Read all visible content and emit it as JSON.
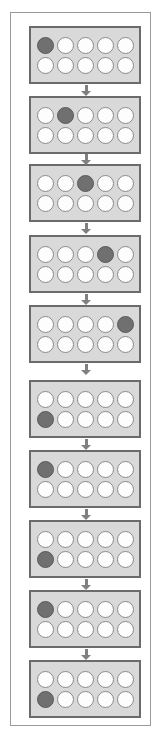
{
  "figure": {
    "title": "",
    "colors": {
      "page_background": "#ffffff",
      "outer_frame_border": "#9a9a9a",
      "panel_background": "#d9d9d9",
      "panel_border": "#6b6b6b",
      "cell_empty_fill": "#fdfdfd",
      "cell_empty_border": "#8a8a8a",
      "cell_filled_fill": "#707070",
      "cell_filled_border": "#5a5a5a",
      "arrow_color": "#808080"
    },
    "grid": {
      "columns": 5,
      "rows": 2,
      "cell_shape": "circle"
    },
    "panel_count": 10,
    "arrow_count": 9,
    "arrow_direction": "down"
  },
  "panels": [
    {
      "index": 1,
      "label": "",
      "top": 26,
      "filled_row": 1,
      "filled_column": 1,
      "cells": [
        [
          "filled",
          "empty",
          "empty",
          "empty",
          "empty"
        ],
        [
          "empty",
          "empty",
          "empty",
          "empty",
          "empty"
        ]
      ]
    },
    {
      "index": 2,
      "label": "",
      "top": 96,
      "filled_row": 1,
      "filled_column": 2,
      "cells": [
        [
          "empty",
          "filled",
          "empty",
          "empty",
          "empty"
        ],
        [
          "empty",
          "empty",
          "empty",
          "empty",
          "empty"
        ]
      ]
    },
    {
      "index": 3,
      "label": "",
      "top": 164,
      "filled_row": 1,
      "filled_column": 3,
      "cells": [
        [
          "empty",
          "empty",
          "filled",
          "empty",
          "empty"
        ],
        [
          "empty",
          "empty",
          "empty",
          "empty",
          "empty"
        ]
      ]
    },
    {
      "index": 4,
      "label": "",
      "top": 235,
      "filled_row": 1,
      "filled_column": 4,
      "cells": [
        [
          "empty",
          "empty",
          "empty",
          "filled",
          "empty"
        ],
        [
          "empty",
          "empty",
          "empty",
          "empty",
          "empty"
        ]
      ]
    },
    {
      "index": 5,
      "label": "",
      "top": 305,
      "filled_row": 1,
      "filled_column": 5,
      "cells": [
        [
          "empty",
          "empty",
          "empty",
          "empty",
          "filled"
        ],
        [
          "empty",
          "empty",
          "empty",
          "empty",
          "empty"
        ]
      ]
    },
    {
      "index": 6,
      "label": "",
      "top": 380,
      "filled_row": 2,
      "filled_column": 1,
      "cells": [
        [
          "empty",
          "empty",
          "empty",
          "empty",
          "empty"
        ],
        [
          "filled",
          "empty",
          "empty",
          "empty",
          "empty"
        ]
      ]
    },
    {
      "index": 7,
      "label": "",
      "top": 450,
      "filled_row": 1,
      "filled_column": 1,
      "cells": [
        [
          "filled",
          "empty",
          "empty",
          "empty",
          "empty"
        ],
        [
          "empty",
          "empty",
          "empty",
          "empty",
          "empty"
        ]
      ]
    },
    {
      "index": 8,
      "label": "",
      "top": 520,
      "filled_row": 2,
      "filled_column": 1,
      "cells": [
        [
          "empty",
          "empty",
          "empty",
          "empty",
          "empty"
        ],
        [
          "filled",
          "empty",
          "empty",
          "empty",
          "empty"
        ]
      ]
    },
    {
      "index": 9,
      "label": "",
      "top": 590,
      "filled_row": 1,
      "filled_column": 1,
      "cells": [
        [
          "filled",
          "empty",
          "empty",
          "empty",
          "empty"
        ],
        [
          "empty",
          "empty",
          "empty",
          "empty",
          "empty"
        ]
      ]
    },
    {
      "index": 10,
      "label": "",
      "top": 660,
      "filled_row": 2,
      "filled_column": 1,
      "cells": [
        [
          "empty",
          "empty",
          "empty",
          "empty",
          "empty"
        ],
        [
          "filled",
          "empty",
          "empty",
          "empty",
          "empty"
        ]
      ]
    }
  ],
  "arrows": [
    {
      "index": 1,
      "top": 85
    },
    {
      "index": 2,
      "top": 154
    },
    {
      "index": 3,
      "top": 223
    },
    {
      "index": 4,
      "top": 294
    },
    {
      "index": 5,
      "top": 364
    },
    {
      "index": 6,
      "top": 439
    },
    {
      "index": 7,
      "top": 509
    },
    {
      "index": 8,
      "top": 579
    },
    {
      "index": 9,
      "top": 649
    }
  ]
}
